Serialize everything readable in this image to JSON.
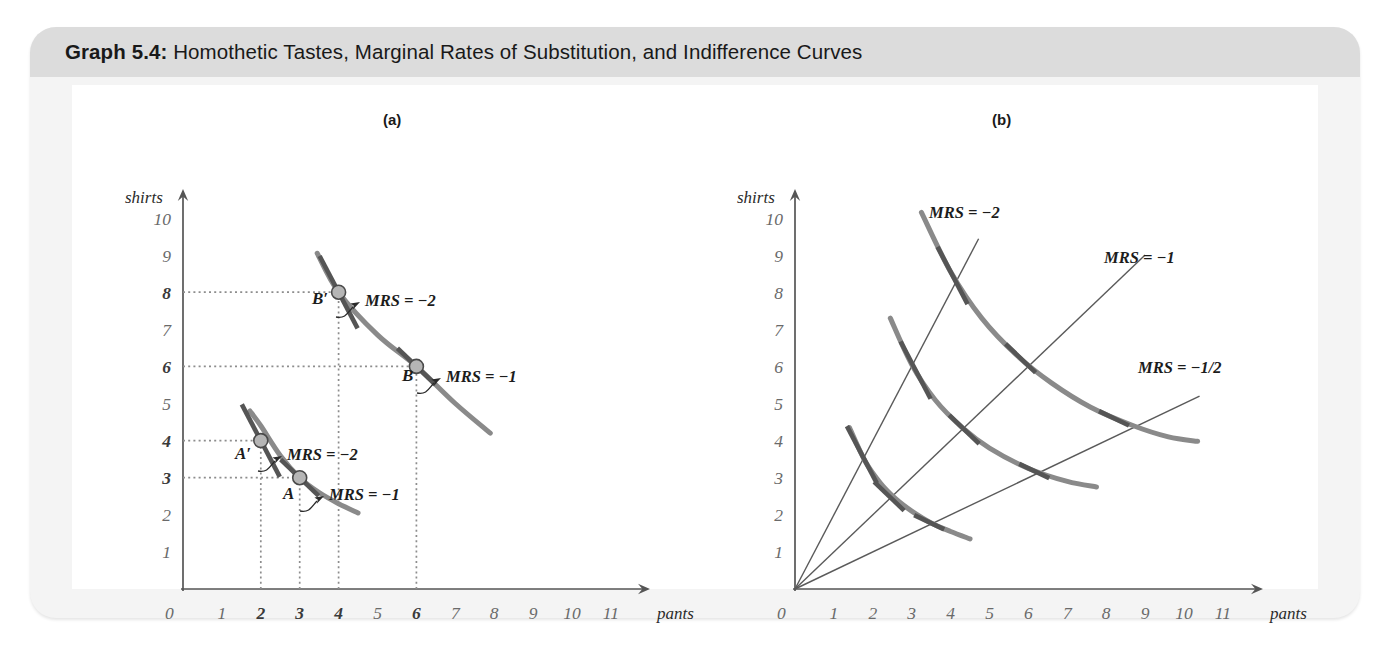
{
  "figure": {
    "title_lead": "Graph 5.4:",
    "title_rest": " Homothetic Tastes, Marginal Rates of Substitution, and Indifference Curves"
  },
  "panels": [
    {
      "key": "a",
      "label": "(a)"
    },
    {
      "key": "b",
      "label": "(b)"
    }
  ],
  "axes": {
    "xlabel": "pants",
    "ylabel": "shirts",
    "origin_label": "0",
    "xticks": [
      "1",
      "2",
      "3",
      "4",
      "5",
      "6",
      "7",
      "8",
      "9",
      "10",
      "11"
    ],
    "yticks": [
      "1",
      "2",
      "3",
      "4",
      "5",
      "6",
      "7",
      "8",
      "9",
      "10"
    ],
    "xlim": [
      0,
      11.7
    ],
    "ylim": [
      0,
      10.6
    ]
  },
  "chart_data": [
    {
      "type": "line",
      "panel": "(a)",
      "title": "Homothetic tastes: MRS along a ray from the origin",
      "xlabel": "pants",
      "ylabel": "shirts",
      "xlim": [
        0,
        11.7
      ],
      "ylim": [
        0,
        10.6
      ],
      "grid": false,
      "legend": "none",
      "bold_xticks": [
        "2",
        "3",
        "4",
        "6"
      ],
      "bold_yticks": [
        "3",
        "4",
        "6",
        "8"
      ],
      "series": [
        {
          "name": "lower indifference curve",
          "comment": "xy = 9 style hyperbola through A(3,3) and A'(2,4)",
          "x": [
            1.72,
            2.0,
            2.5,
            3.0,
            3.5,
            4.0,
            4.5
          ],
          "y": [
            4.8,
            4.4,
            3.6,
            3.0,
            2.6,
            2.3,
            2.05
          ]
        },
        {
          "name": "upper indifference curve",
          "comment": "through B(6,6) and B'(4,8)",
          "x": [
            3.45,
            4.0,
            5.0,
            6.0,
            7.0,
            7.9
          ],
          "y": [
            9.05,
            8.0,
            6.85,
            6.0,
            5.0,
            4.2
          ]
        }
      ],
      "points": [
        {
          "label": "A",
          "x": 3,
          "y": 3,
          "mrs": "MRS = −1"
        },
        {
          "label": "A′",
          "x": 2,
          "y": 4,
          "mrs": "MRS = −2"
        },
        {
          "label": "B",
          "x": 6,
          "y": 6,
          "mrs": "MRS = −1"
        },
        {
          "label": "B′",
          "x": 4,
          "y": 8,
          "mrs": "MRS = −2"
        }
      ],
      "annotations": [
        "MRS = −2",
        "MRS = −1",
        "MRS = −2",
        "MRS = −1"
      ],
      "dotted_guides": {
        "vertical_at_x": [
          2,
          3,
          4,
          6
        ],
        "horizontal_at_y": [
          3,
          4,
          6,
          8
        ]
      }
    },
    {
      "type": "line",
      "panel": "(b)",
      "title": "Rays of constant MRS crossing a family of indifference curves",
      "xlabel": "pants",
      "ylabel": "shirts",
      "xlim": [
        0,
        11.7
      ],
      "ylim": [
        0,
        10.6
      ],
      "grid": false,
      "legend": "none",
      "rays": [
        {
          "label": "MRS = −2",
          "slope": 2.0,
          "x_end": 4.72
        },
        {
          "label": "MRS = −1",
          "slope": 1.0,
          "x_end": 9.0
        },
        {
          "label": "MRS = −1/2",
          "slope": 0.5,
          "x_end": 10.4
        }
      ],
      "series": [
        {
          "name": "inner indifference curve",
          "x": [
            1.4,
            1.8,
            2.2,
            2.6,
            3.0,
            3.5,
            4.0,
            4.5
          ],
          "y": [
            4.35,
            3.45,
            2.85,
            2.42,
            2.1,
            1.78,
            1.55,
            1.35
          ]
        },
        {
          "name": "middle indifference curve",
          "x": [
            2.45,
            3.0,
            3.6,
            4.3,
            5.0,
            6.0,
            7.0,
            7.75
          ],
          "y": [
            7.3,
            6.05,
            5.1,
            4.35,
            3.8,
            3.25,
            2.9,
            2.75
          ]
        },
        {
          "name": "outer indifference curve",
          "x": [
            3.25,
            4.0,
            4.8,
            5.7,
            6.6,
            7.6,
            8.7,
            9.6,
            10.35
          ],
          "y": [
            10.15,
            8.55,
            7.3,
            6.3,
            5.55,
            4.9,
            4.4,
            4.1,
            3.98
          ]
        }
      ],
      "tangency_points": [
        {
          "curve": "inner",
          "mrs": "−2",
          "x": 1.72,
          "y": 3.62
        },
        {
          "curve": "inner",
          "mrs": "−1",
          "x": 2.42,
          "y": 2.5
        },
        {
          "curve": "inner",
          "mrs": "−1/2",
          "x": 3.45,
          "y": 1.8
        },
        {
          "curve": "middle",
          "mrs": "−2",
          "x": 3.1,
          "y": 5.9
        },
        {
          "curve": "middle",
          "mrs": "−1",
          "x": 4.35,
          "y": 4.3
        },
        {
          "curve": "middle",
          "mrs": "−1/2",
          "x": 6.15,
          "y": 3.18
        },
        {
          "curve": "outer",
          "mrs": "−2",
          "x": 4.05,
          "y": 8.45
        },
        {
          "curve": "outer",
          "mrs": "−1",
          "x": 5.8,
          "y": 6.22
        },
        {
          "curve": "outer",
          "mrs": "−1/2",
          "x": 8.2,
          "y": 4.6
        }
      ]
    }
  ]
}
